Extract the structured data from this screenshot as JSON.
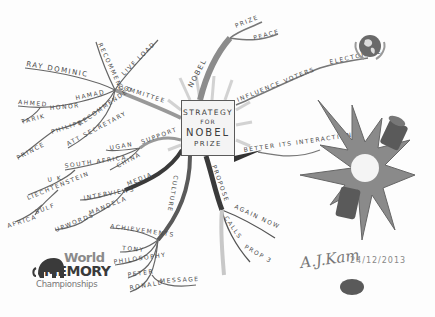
{
  "center": {
    "line1": "STRATEGY",
    "line2": "FOR",
    "line3": "NOBEL",
    "line4": "PRIZE"
  },
  "branches": {
    "nobel": {
      "label": "NOBEL",
      "children": [
        "PRIZE",
        "PEACE"
      ]
    },
    "voters": {
      "label": "INFLUENCE VOTERS",
      "children": [
        "ELECTORATE"
      ]
    },
    "better": {
      "label": "BETTER ITS INTERACTIONS"
    },
    "propose": {
      "label": "PROPOSE",
      "children": [
        "AGAIN NOW",
        "CALLS",
        "PROP 3"
      ]
    },
    "culture": {
      "label": "CULTURE",
      "children": [
        "ACHIEVEMENTS",
        "TONY",
        "PHILOSOPHY",
        "PETER",
        "RONALD",
        "MESSAGE"
      ]
    },
    "media": {
      "label": "MEDIA",
      "children": [
        "INTERVIEWS",
        "MANDELA",
        "UPWORDS"
      ]
    },
    "support": {
      "label": "SUPPORT",
      "children": [
        "UGAN",
        "SOUTH AFRICA",
        "CHINA",
        "U K",
        "LIECHTENSTEIN",
        "SULF",
        "AFRICA"
      ]
    },
    "committee": {
      "label": "COMMITTEE",
      "children": [
        "RAY DOMINIC",
        "HAMAD",
        "AHMED",
        "HONOR",
        "TARIK",
        "PHILIPE",
        "RECOMMENDED",
        "PRINCE",
        "ATT SECRETARY",
        "RECOMMEND",
        "LIVE LOAD"
      ]
    }
  },
  "logo": {
    "world": "World",
    "memory": "MEMORY",
    "championships": "Championships"
  },
  "signature": {
    "name": "A.J.Kam",
    "date": "24/12/2013"
  },
  "icons": [
    "globe-emblem-icon",
    "explosion-icon",
    "broken-battery-icon",
    "mammoth-icon",
    "ink-blot-icon"
  ]
}
